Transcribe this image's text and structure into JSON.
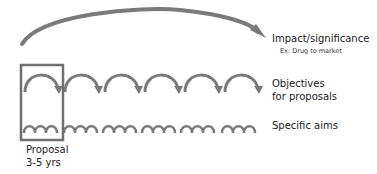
{
  "diagram": {
    "levels": [
      {
        "id": "impact",
        "label": "Impact/significance",
        "sublabel": "Ex: Drug to market"
      },
      {
        "id": "objectives",
        "label_line1": "Objectives",
        "label_line2": "for proposals"
      },
      {
        "id": "aims",
        "label": "Specific aims"
      }
    ],
    "proposal_box": {
      "label_line1": "Proposal",
      "label_line2": "3-5 yrs"
    },
    "counts": {
      "objective_arcs": 6,
      "aim_arcs": 18
    },
    "colors": {
      "arrow": "#7a7a7a",
      "box": "#6f6f6f",
      "text": "#222222"
    }
  }
}
